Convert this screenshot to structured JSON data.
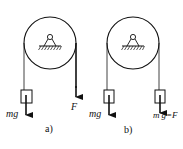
{
  "diagrams": [
    {
      "id": "a",
      "caption": "a)",
      "left_label": "mg",
      "right_label": "F",
      "description": "Fixed pulley with mass m on left rope; force F pulling right rope downward"
    },
    {
      "id": "b",
      "caption": "b)",
      "left_label": "mg",
      "right_label": "m'g=F",
      "description": "Fixed pulley with mass m on left rope and mass m' on right rope, weight m'g equal to F"
    }
  ],
  "colors": {
    "stroke": "#111111",
    "background": "#ffffff"
  }
}
